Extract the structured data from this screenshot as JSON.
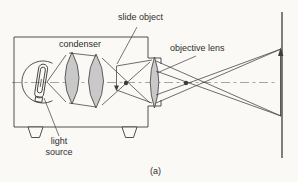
{
  "figure": {
    "caption": "(a)",
    "labels": {
      "slide_object": "slide object",
      "objective_lens": "objective lens",
      "condenser": "condenser",
      "light_source_lines": [
        "light",
        "source"
      ]
    },
    "colors": {
      "line": "#3d3d3d",
      "lens_fill": "#c9c9c9",
      "axis": "#8f8f8f",
      "text": "#2e2e2e",
      "background": "#faf9f6"
    }
  }
}
